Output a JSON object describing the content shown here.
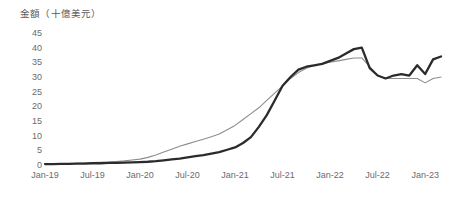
{
  "chart_data": {
    "type": "line",
    "title": "金額（十億美元）",
    "xlabel": "",
    "ylabel": "金額（十億美元）",
    "ylim": [
      0,
      45
    ],
    "ytick_values": [
      0,
      5,
      10,
      15,
      20,
      25,
      30,
      35,
      40,
      45
    ],
    "ytick_labels": [
      "0",
      "5",
      "10",
      "15",
      "20",
      "25",
      "30",
      "35",
      "40",
      "45"
    ],
    "xtick_labels": [
      "Jan-19",
      "Jul-19",
      "Jan-20",
      "Jul-20",
      "Jan-21",
      "Jul-21",
      "Jan-22",
      "Jul-22",
      "Jan-23"
    ],
    "xtick_positions": [
      0,
      6,
      12,
      18,
      24,
      30,
      36,
      42,
      48
    ],
    "grid": false,
    "legend": "none",
    "x_range_months": [
      0,
      50
    ],
    "x": [
      0,
      1,
      2,
      3,
      4,
      5,
      6,
      7,
      8,
      9,
      10,
      11,
      12,
      13,
      14,
      15,
      16,
      17,
      18,
      19,
      20,
      21,
      22,
      23,
      24,
      25,
      26,
      27,
      28,
      29,
      30,
      31,
      32,
      33,
      34,
      35,
      36,
      37,
      38,
      39,
      40,
      41,
      42,
      43,
      44,
      45,
      46,
      47,
      48,
      49,
      50
    ],
    "series": [
      {
        "name": "series-dark",
        "color": "#2b2b2b",
        "width": 2.3,
        "values": [
          0.3,
          0.3,
          0.4,
          0.4,
          0.5,
          0.5,
          0.6,
          0.6,
          0.7,
          0.7,
          0.8,
          0.9,
          1.0,
          1.1,
          1.3,
          1.6,
          1.9,
          2.2,
          2.6,
          3.0,
          3.4,
          3.9,
          4.4,
          5.2,
          6.0,
          7.5,
          9.5,
          13.0,
          17.0,
          22.0,
          27.0,
          30.0,
          32.5,
          33.5,
          34.0,
          34.5,
          35.5,
          36.5,
          38.0,
          39.5,
          40.0,
          33.0,
          30.5,
          29.5,
          30.5,
          31.0,
          30.5,
          34.0,
          31.0,
          36.0,
          37.0
        ]
      },
      {
        "name": "series-gray",
        "color": "#8d8d8d",
        "width": 1.1,
        "values": [
          0.4,
          0.4,
          0.5,
          0.5,
          0.6,
          0.7,
          0.8,
          0.9,
          1.0,
          1.2,
          1.4,
          1.7,
          2.0,
          2.6,
          3.4,
          4.4,
          5.4,
          6.4,
          7.2,
          8.0,
          8.8,
          9.6,
          10.6,
          12.0,
          13.5,
          15.5,
          17.5,
          19.5,
          22.0,
          24.5,
          27.0,
          29.5,
          31.5,
          33.0,
          34.0,
          34.5,
          35.0,
          35.5,
          36.0,
          36.5,
          36.5,
          33.5,
          30.5,
          29.5,
          29.5,
          29.5,
          29.5,
          29.5,
          28.0,
          29.5,
          30.0
        ]
      }
    ]
  }
}
